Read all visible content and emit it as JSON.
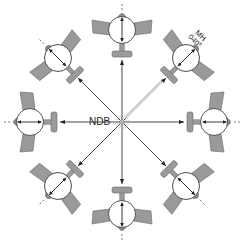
{
  "diagram": {
    "center_label": "NDB",
    "heading_label_line1": "MH",
    "heading_label_line2": "040°",
    "colors": {
      "plane_fill": "#9a9a9a",
      "plane_stroke": "#555555",
      "line": "#333333",
      "highlight_bearing": "#c8c8c8",
      "background": "#ffffff"
    },
    "aircraft": [
      {
        "position": "north",
        "angle": 0
      },
      {
        "position": "northeast",
        "angle": 45
      },
      {
        "position": "east",
        "angle": 90
      },
      {
        "position": "southeast",
        "angle": 135
      },
      {
        "position": "south",
        "angle": 180
      },
      {
        "position": "southwest",
        "angle": 225
      },
      {
        "position": "west",
        "angle": 270
      },
      {
        "position": "northwest",
        "angle": 315
      }
    ]
  }
}
